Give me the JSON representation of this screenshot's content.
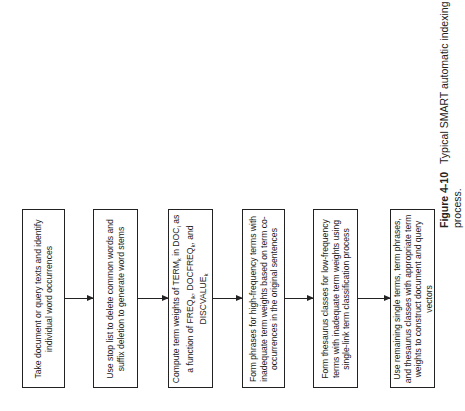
{
  "diagram": {
    "type": "flowchart",
    "orientation": "rotated-90",
    "steps": [
      {
        "id": 1,
        "text": "Take document or query texts and identify individual word occurrences"
      },
      {
        "id": 2,
        "text": "Use stop list to delete common words and suffix deletion to generate word stems"
      },
      {
        "id": 3,
        "text_parts": [
          "Compute term weights of TERM",
          "k",
          " in DOC",
          "i",
          " as a function of FREQ",
          "ik",
          ", DOCFREQ",
          "k",
          ", and DISCVALUE",
          "k"
        ]
      },
      {
        "id": 4,
        "text": "Form phrases for high-frequency terms with inadequate term weights based on term co-occurrences in the original sentences"
      },
      {
        "id": 5,
        "text": "Form thesaurus classes for low-frequency terms with inadequate term weights using single-link term classification process"
      },
      {
        "id": 6,
        "text": "Use remaining single terms, term phrases, and thesaurus classes with appropriate term weights to construct document and query vectors"
      }
    ],
    "edges": [
      [
        1,
        2
      ],
      [
        2,
        3
      ],
      [
        3,
        4
      ],
      [
        4,
        5
      ],
      [
        5,
        6
      ]
    ]
  },
  "caption": {
    "label": "Figure 4-10",
    "text": "Typical SMART automatic indexing process."
  }
}
